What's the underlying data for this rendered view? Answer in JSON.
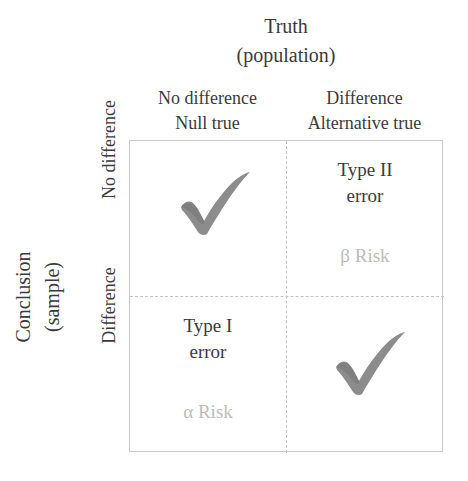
{
  "figure": {
    "type": "2x2-decision-matrix",
    "column_group_title": [
      "Truth",
      "(population)"
    ],
    "row_group_title": [
      "Conclusion",
      "(sample)"
    ],
    "columns": [
      {
        "line1": "No difference",
        "line2": "Null true"
      },
      {
        "line1": "Difference",
        "line2": "Alternative true"
      }
    ],
    "rows": [
      {
        "label": "No difference"
      },
      {
        "label": "Difference"
      }
    ],
    "cells": {
      "top_left": {
        "mark": "check-mark",
        "title": "",
        "risk": ""
      },
      "top_right": {
        "mark": "",
        "title_line1": "Type II",
        "title_line2": "error",
        "risk": "β Risk"
      },
      "bottom_left": {
        "mark": "",
        "title_line1": "Type I",
        "title_line2": "error",
        "risk": "α Risk"
      },
      "bottom_right": {
        "mark": "check-mark",
        "title": "",
        "risk": ""
      }
    },
    "colors": {
      "text_dark": "#3a3a3a",
      "text_risk_gray": "#bcbcbc",
      "check_gray": "#8c8c8c",
      "border_gray": "#c9c9c9",
      "divider_gray": "#c2c2c2",
      "background": "#ffffff"
    }
  }
}
